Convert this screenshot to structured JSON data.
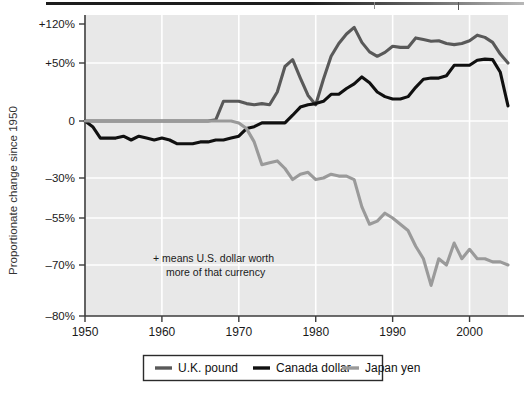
{
  "figure": {
    "y_axis_title": "Proportionate change since 1950",
    "annotation_line1": "+ means U.S. dollar worth",
    "annotation_line2": "more of that currency"
  },
  "colors": {
    "uk_pound": "#595959",
    "canada_dollar": "#101010",
    "japan_yen": "#9a9a9a",
    "plot_background": "#e8e8e8",
    "gridline": "#ffffff",
    "axis": "#3c3c3c",
    "legend_border": "#2b2b2b"
  },
  "legend": {
    "items": [
      {
        "label": "U.K. pound",
        "color_key": "uk_pound"
      },
      {
        "label": "Canada dollar",
        "color_key": "canada_dollar"
      },
      {
        "label": "Japan yen",
        "color_key": "japan_yen"
      }
    ]
  },
  "chart_data": {
    "type": "line",
    "title": "",
    "xlabel": "",
    "ylabel": "Proportionate change since 1950",
    "xlim": [
      1950,
      2005
    ],
    "grid": true,
    "legend_position": "below",
    "annotations": [
      "+ means U.S. dollar worth more of that currency"
    ],
    "y_tick_labels": [
      "+120%",
      "+50%",
      "0",
      "-30%",
      "-55%",
      "-70%",
      "-80%"
    ],
    "y_tick_values": [
      120,
      50,
      0,
      -30,
      -55,
      -70,
      -80
    ],
    "y_tick_pixels": [
      24,
      63,
      121,
      178,
      218,
      265,
      316
    ],
    "x_tick_labels": [
      "1950",
      "1960",
      "1970",
      "1980",
      "1990",
      "2000"
    ],
    "x_tick_values": [
      1950,
      1960,
      1970,
      1980,
      1990,
      2000
    ],
    "x": [
      1950,
      1951,
      1952,
      1953,
      1954,
      1955,
      1956,
      1957,
      1958,
      1959,
      1960,
      1961,
      1962,
      1963,
      1964,
      1965,
      1966,
      1967,
      1968,
      1969,
      1970,
      1971,
      1972,
      1973,
      1974,
      1975,
      1976,
      1977,
      1978,
      1979,
      1980,
      1981,
      1982,
      1983,
      1984,
      1985,
      1986,
      1987,
      1988,
      1989,
      1990,
      1991,
      1992,
      1993,
      1994,
      1995,
      1996,
      1997,
      1998,
      1999,
      2000,
      2001,
      2002,
      2003,
      2004,
      2005
    ],
    "series": [
      {
        "name": "U.K. pound",
        "color": "#595959",
        "values": [
          0,
          0,
          0,
          0,
          0,
          0,
          0,
          0,
          0,
          0,
          0,
          0,
          0,
          0,
          0,
          0,
          0,
          1,
          17,
          17,
          17,
          15,
          14,
          15,
          14,
          25,
          47,
          56,
          37,
          22,
          14,
          36,
          62,
          85,
          102,
          114,
          87,
          70,
          62,
          69,
          80,
          78,
          78,
          95,
          92,
          89,
          90,
          85,
          83,
          85,
          90,
          100,
          96,
          87,
          66,
          50
        ]
      },
      {
        "name": "Canada dollar",
        "color": "#101010",
        "values": [
          0,
          -3,
          -9,
          -9,
          -9,
          -8,
          -10,
          -8,
          -9,
          -10,
          -9,
          -10,
          -12,
          -12,
          -12,
          -11,
          -11,
          -10,
          -10,
          -9,
          -8,
          -4,
          -3,
          -1,
          -1,
          -1,
          -1,
          5,
          12,
          14,
          15,
          17,
          23,
          23,
          28,
          32,
          38,
          33,
          25,
          21,
          19,
          19,
          21,
          29,
          36,
          37,
          37,
          39,
          48,
          48,
          48,
          55,
          57,
          56,
          42,
          13
        ]
      },
      {
        "name": "Japan yen",
        "color": "#9a9a9a",
        "values": [
          0,
          0,
          0,
          0,
          0,
          0,
          0,
          0,
          0,
          0,
          0,
          0,
          0,
          0,
          0,
          0,
          0,
          0,
          0,
          0,
          -1,
          -4,
          -11,
          -23,
          -22,
          -21,
          -25,
          -31,
          -28,
          -27,
          -31,
          -30,
          -28,
          -29,
          -29,
          -31,
          -48,
          -57,
          -56,
          -52,
          -55,
          -57,
          -59,
          -64,
          -68,
          -74,
          -68,
          -70,
          -63,
          -68,
          -65,
          -68,
          -68,
          -69,
          -69,
          -70
        ]
      }
    ]
  }
}
